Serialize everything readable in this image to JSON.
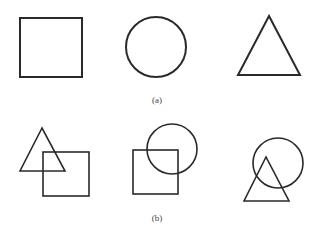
{
  "labels": {
    "a": "(a)",
    "b": "(b)"
  },
  "stroke_color": "#2a2a2a",
  "panel_a": [
    "square",
    "circle",
    "triangle"
  ],
  "panel_b": [
    "triangle-overlapping-square",
    "square-overlapping-circle",
    "circle-overlapping-triangle"
  ]
}
